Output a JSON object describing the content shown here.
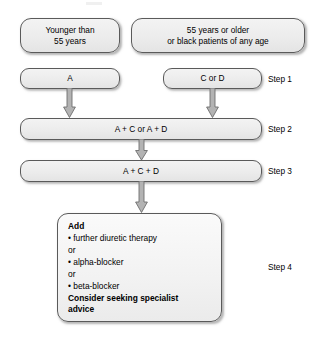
{
  "diagram": {
    "branches": {
      "left": "Younger than\n55 years",
      "left_line1": "Younger than",
      "left_line2": "55 years",
      "right_line1": "55 years or older",
      "right_line2": "or black patients of any age"
    },
    "steps": [
      {
        "id": "step1",
        "label": "Step 1",
        "left_box": "A",
        "right_box": "C or D"
      },
      {
        "id": "step2",
        "label": "Step 2",
        "box": "A + C or A + D"
      },
      {
        "id": "step3",
        "label": "Step 3",
        "box": "A + C + D"
      },
      {
        "id": "step4",
        "label": "Step 4"
      }
    ],
    "step4_panel": {
      "heading": "Add",
      "item1": "• further diuretic therapy",
      "or1": "or",
      "item2": "• alpha-blocker",
      "or2": "or",
      "item3": "• beta-blocker",
      "footer_line1": "Consider seeking specialist",
      "footer_line2": "advice"
    },
    "colors": {
      "box_fill": "#ececec",
      "box_border": "#5a5a5a",
      "arrow_fill": "#b0b0b0",
      "arrow_border": "#6e6e6e",
      "text": "#000000",
      "background": "#ffffff"
    }
  }
}
